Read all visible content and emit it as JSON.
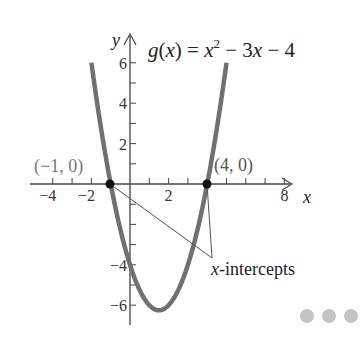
{
  "chart_data": {
    "type": "line",
    "function": "x^2 - 3x - 4",
    "title_parts": {
      "lhs": "g(x) = x",
      "sup": "2",
      "rhs": " − 3x − 4"
    },
    "xlabel": "x",
    "ylabel": "y",
    "xlim": [
      -5,
      9
    ],
    "ylim": [
      -7,
      7
    ],
    "grid": false,
    "x_ticks": [
      -4,
      -3,
      -2,
      -1,
      1,
      2,
      3,
      4,
      5,
      6,
      7,
      8
    ],
    "x_tick_labels": [
      {
        "value": -4,
        "label": "−4"
      },
      {
        "value": -2,
        "label": "−2"
      },
      {
        "value": 2,
        "label": "2"
      },
      {
        "value": 8,
        "label": "8"
      }
    ],
    "y_ticks": [
      -6,
      -5,
      -4,
      -3,
      -2,
      -1,
      1,
      2,
      3,
      4,
      5,
      6
    ],
    "y_tick_labels": [
      {
        "value": 6,
        "label": "6"
      },
      {
        "value": 4,
        "label": "4"
      },
      {
        "value": 2,
        "label": "2"
      },
      {
        "value": -4,
        "label": "−4"
      },
      {
        "value": -6,
        "label": "−6"
      }
    ],
    "series": [
      {
        "name": "g(x)",
        "color": "#707070",
        "x": [
          -2,
          -1.5,
          -1,
          -0.5,
          0,
          0.5,
          1,
          1.5,
          2,
          2.5,
          3,
          3.5,
          4,
          4.5,
          5
        ],
        "y": [
          6,
          2.75,
          0,
          -2.25,
          -4,
          -5.25,
          -6,
          -6.25,
          -6,
          -5.25,
          -4,
          -2.25,
          0,
          2.75,
          6
        ]
      }
    ],
    "points": [
      {
        "x": -1,
        "y": 0,
        "label": "(−1, 0)"
      },
      {
        "x": 4,
        "y": 0,
        "label": "(4, 0)"
      }
    ],
    "annotations": [
      {
        "text": "x-intercepts",
        "points_to": [
          [
            -1,
            0
          ],
          [
            4,
            0
          ]
        ]
      }
    ],
    "vertex": {
      "x": 1.5,
      "y": -6.25
    }
  },
  "labels": {
    "left_point": "(−1, 0)",
    "right_point": "(4, 0)",
    "annotation": "-intercepts",
    "annotation_var": "x",
    "axis_x": "x",
    "axis_y": "y"
  },
  "pager": {
    "dots": 3,
    "color": "#c4c4c4"
  }
}
